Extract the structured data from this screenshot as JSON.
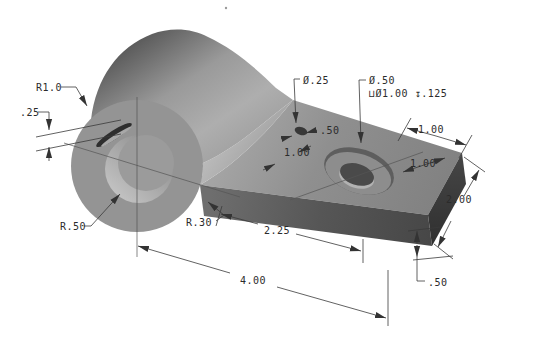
{
  "page": {
    "background": "#ffffff"
  },
  "drawing": {
    "kind": "isometric-cad-part-with-dimensions",
    "line_color": "#3a3a3a",
    "part_colors": {
      "cylinder_dark": "#474747",
      "cylinder_light": "#adadad",
      "face_gray": "#949494",
      "top_face": "#8f8f8f",
      "front_face": "#555555",
      "right_face": "#383838",
      "hole_light": "#c4c4c4"
    },
    "annotations": {
      "boss_radius": "R1.0",
      "slot_depth": ".25",
      "bore_radius": "R.50",
      "fillet_radius": "R.30",
      "small_hole_dia": "Ø.25",
      "small_hole_edge_offset": ".50",
      "small_hole_spacing": "1.00",
      "cbore_dia": "Ø.50",
      "cbore_note": "⊔Ø1.00 ↧.125",
      "hole_to_end": "1.00",
      "hole_to_side": "1.00",
      "plate_segment_length": "2.25",
      "overall_length": "4.00",
      "plate_width": "2.00",
      "plate_thickness": ".50"
    }
  }
}
